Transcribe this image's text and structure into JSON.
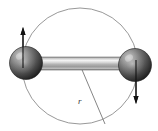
{
  "figure": {
    "background_color": "#ffffff",
    "width": 158,
    "height": 131
  },
  "circle": {
    "name": "rotation-orbit-circle",
    "center_x": 80,
    "center_y": 66,
    "radius": 58,
    "stroke_color": "#8c8c8c",
    "stroke_width": 0.9,
    "fill": "none"
  },
  "rod": {
    "name": "connecting-rod",
    "x1": 24,
    "y1": 63.5,
    "x2": 136,
    "y2": 65.5,
    "thickness": 13,
    "light_color": "#f2f2f2",
    "mid_color": "#b8b8b8",
    "dark_color": "#8f8f8f",
    "edge_color": "#6e6e6e"
  },
  "spheres": [
    {
      "name": "left-mass-sphere",
      "label": "",
      "cx": 26,
      "cy": 63,
      "r": 16.5,
      "highlight_x": 20,
      "highlight_y": 56,
      "base_color": "#3c3c3c",
      "mid_color": "#6b6b6b",
      "highlight_color": "#b9b9b9",
      "edge_color": "#1b1b1b"
    },
    {
      "name": "right-mass-sphere",
      "label": "",
      "cx": 135,
      "cy": 65,
      "r": 16.5,
      "highlight_x": 129,
      "highlight_y": 58,
      "base_color": "#3c3c3c",
      "mid_color": "#6b6b6b",
      "highlight_color": "#b9b9b9",
      "edge_color": "#1b1b1b"
    }
  ],
  "arrows": [
    {
      "name": "left-velocity-arrow-up",
      "direction": "up",
      "x": 23,
      "tail_y": 68,
      "head_y": 27,
      "color": "#111111",
      "stroke_width": 1.1,
      "head_width": 5,
      "head_length": 8
    },
    {
      "name": "right-velocity-arrow-down",
      "direction": "down",
      "x": 136,
      "tail_y": 60,
      "head_y": 104,
      "color": "#111111",
      "stroke_width": 1.1,
      "head_width": 5,
      "head_length": 8
    }
  ],
  "radius_line": {
    "name": "radius-leader-line",
    "x1": 80,
    "y1": 65,
    "x2": 105,
    "y2": 124,
    "stroke_color": "#777777",
    "stroke_width": 0.9
  },
  "radius_label": {
    "name": "radius-label",
    "text": "r",
    "x": 78,
    "y": 104,
    "color": "#3a3a3a",
    "style": "italic"
  }
}
